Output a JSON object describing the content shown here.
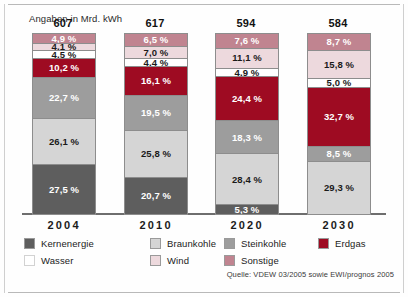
{
  "chart_data": {
    "type": "bar",
    "subtype": "stacked-percentage",
    "title": "",
    "unit_note": "Angaben in Mrd. kWh",
    "xlabel": "",
    "ylabel": "",
    "ylim": [
      0,
      100
    ],
    "grid": false,
    "legend_position": "bottom",
    "categories": [
      "2004",
      "2010",
      "2020",
      "2030"
    ],
    "totals": [
      "607",
      "617",
      "594",
      "584"
    ],
    "totals_values": [
      607,
      617,
      594,
      584
    ],
    "series": [
      {
        "name": "Kernenergie",
        "color": "#5e5e5e",
        "label_color": "#ffffff",
        "values": [
          27.5,
          20.7,
          5.3,
          0
        ],
        "labels": [
          "27,5 %",
          "20,7 %",
          "5,3 %",
          ""
        ]
      },
      {
        "name": "Braunkohle",
        "color": "#d5d5d5",
        "label_color": "#1a1a1a",
        "values": [
          26.1,
          25.8,
          28.4,
          29.3
        ],
        "labels": [
          "26,1 %",
          "25,8 %",
          "28,4 %",
          "29,3 %"
        ]
      },
      {
        "name": "Steinkohle",
        "color": "#9d9d9d",
        "label_color": "#ffffff",
        "values": [
          22.7,
          19.5,
          18.3,
          8.5
        ],
        "labels": [
          "22,7 %",
          "19,5 %",
          "18,3 %",
          "8,5 %"
        ]
      },
      {
        "name": "Erdgas",
        "color": "#9e0b22",
        "label_color": "#ffffff",
        "values": [
          10.2,
          16.1,
          24.4,
          32.7
        ],
        "labels": [
          "10,2 %",
          "16,1 %",
          "24,4 %",
          "32,7 %"
        ]
      },
      {
        "name": "Wasser",
        "color": "#ffffff",
        "label_color": "#1a1a1a",
        "values": [
          4.5,
          4.4,
          4.9,
          5.0
        ],
        "labels": [
          "4,5 %",
          "4,4 %",
          "4,9 %",
          "5,0 %"
        ]
      },
      {
        "name": "Wind",
        "color": "#edd9dd",
        "label_color": "#1a1a1a",
        "values": [
          4.1,
          7.0,
          11.1,
          15.8
        ],
        "labels": [
          "4,1 %",
          "7,0 %",
          "11,1 %",
          "15,8 %"
        ]
      },
      {
        "name": "Sonstige",
        "color": "#c08490",
        "label_color": "#ffffff",
        "values": [
          4.9,
          6.5,
          7.6,
          8.7
        ],
        "labels": [
          "4,9 %",
          "6,5 %",
          "7,6 %",
          "8,7 %"
        ]
      }
    ],
    "stack_order_bottom_to_top": [
      "Kernenergie",
      "Braunkohle",
      "Steinkohle",
      "Erdgas",
      "Wasser",
      "Wind",
      "Sonstige"
    ],
    "source": "Quelle: VDEW 03/2005 sowie EWI/prognos 2005"
  },
  "legend": {
    "entries": [
      {
        "label": "Kernenergie",
        "color": "#5e5e5e",
        "col": 0,
        "row": 0
      },
      {
        "label": "Wasser",
        "color": "#ffffff",
        "col": 0,
        "row": 1
      },
      {
        "label": "Braunkohle",
        "color": "#d5d5d5",
        "col": 1,
        "row": 0
      },
      {
        "label": "Wind",
        "color": "#edd9dd",
        "col": 1,
        "row": 1
      },
      {
        "label": "Steinkohle",
        "color": "#9d9d9d",
        "col": 2,
        "row": 0
      },
      {
        "label": "Sonstige",
        "color": "#c08490",
        "col": 2,
        "row": 1
      },
      {
        "label": "Erdgas",
        "color": "#9e0b22",
        "col": 3,
        "row": 0
      }
    ]
  }
}
